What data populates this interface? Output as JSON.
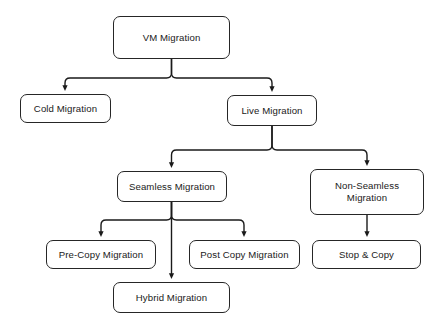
{
  "diagram": {
    "background_color": "#ffffff",
    "node_fill_color": "#ffffff",
    "node_border_color": "#262626",
    "text_color": "#1a1a1a",
    "edge_color": "#1a1a1a",
    "nodes": [
      {
        "id": "vm-migration",
        "label": "VM Migration",
        "level": 0,
        "x": 113,
        "y": 16,
        "width": 117,
        "height": 43
      },
      {
        "id": "cold-migration",
        "label": "Cold Migration",
        "level": 1,
        "x": 20,
        "y": 94,
        "width": 91,
        "height": 29
      },
      {
        "id": "live-migration",
        "label": "Live Migration",
        "level": 1,
        "x": 227,
        "y": 95,
        "width": 90,
        "height": 31
      },
      {
        "id": "seamless-migration",
        "label": "Seamless Migration",
        "level": 2,
        "x": 117,
        "y": 171,
        "width": 110,
        "height": 31
      },
      {
        "id": "non-seamless-migration",
        "label": "Non-Seamless\nMigration",
        "level": 2,
        "x": 310,
        "y": 169,
        "width": 114,
        "height": 46
      },
      {
        "id": "pre-copy-migration",
        "label": "Pre-Copy Migration",
        "level": 3,
        "x": 46,
        "y": 240,
        "width": 110,
        "height": 29
      },
      {
        "id": "post-copy-migration",
        "label": "Post Copy Migration",
        "level": 3,
        "x": 189,
        "y": 240,
        "width": 111,
        "height": 29
      },
      {
        "id": "stop-and-copy",
        "label": "Stop & Copy",
        "level": 3,
        "x": 312,
        "y": 240,
        "width": 109,
        "height": 29
      },
      {
        "id": "hybrid-migration",
        "label": "Hybrid Migration",
        "level": 3,
        "x": 113,
        "y": 282,
        "width": 117,
        "height": 31
      }
    ],
    "edges": [
      {
        "id": "edge-vm-to-cold",
        "from": "vm-migration",
        "to": "cold-migration",
        "style": "elbow",
        "arrow": true
      },
      {
        "id": "edge-vm-to-live",
        "from": "vm-migration",
        "to": "live-migration",
        "style": "elbow",
        "arrow": true
      },
      {
        "id": "edge-live-to-seamless",
        "from": "live-migration",
        "to": "seamless-migration",
        "style": "elbow",
        "arrow": true
      },
      {
        "id": "edge-live-to-non-seamless",
        "from": "live-migration",
        "to": "non-seamless-migration",
        "style": "elbow",
        "arrow": true
      },
      {
        "id": "edge-seamless-to-pre-copy",
        "from": "seamless-migration",
        "to": "pre-copy-migration",
        "style": "elbow",
        "arrow": true
      },
      {
        "id": "edge-seamless-to-post-copy",
        "from": "seamless-migration",
        "to": "post-copy-migration",
        "style": "elbow",
        "arrow": true
      },
      {
        "id": "edge-seamless-to-hybrid",
        "from": "seamless-migration",
        "to": "hybrid-migration",
        "style": "straight",
        "arrow": true
      },
      {
        "id": "edge-non-seamless-to-stop-copy",
        "from": "non-seamless-migration",
        "to": "stop-and-copy",
        "style": "straight",
        "arrow": true
      }
    ]
  }
}
